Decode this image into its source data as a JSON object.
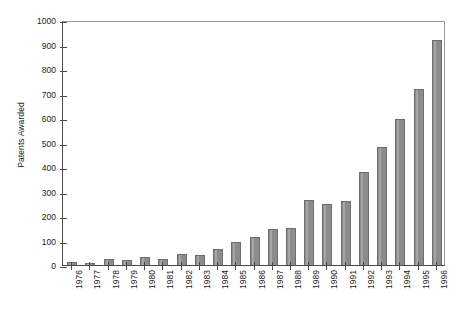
{
  "chart_data": {
    "type": "bar",
    "title": "",
    "xlabel": "",
    "ylabel": "Patents Awarded",
    "ylim": [
      0,
      1000
    ],
    "ytick_step": 100,
    "grid": false,
    "legend": "none",
    "bar_color": "#8c8c8c",
    "bar_edge_color": "#6e6e6e",
    "axis_color": "#4a4a4a",
    "categories": [
      "1976",
      "1977",
      "1978",
      "1979",
      "1980",
      "1981",
      "1982",
      "1983",
      "1984",
      "1985",
      "1986",
      "1987",
      "1988",
      "1989",
      "1990",
      "1991",
      "1992",
      "1993",
      "1994",
      "1995",
      "1996"
    ],
    "values": [
      12,
      8,
      25,
      22,
      32,
      25,
      45,
      42,
      65,
      92,
      113,
      148,
      152,
      265,
      248,
      263,
      378,
      480,
      598,
      718,
      918
    ],
    "ytick_labels": [
      "0",
      "100",
      "200",
      "300",
      "400",
      "500",
      "600",
      "700",
      "800",
      "900",
      "1000"
    ],
    "ytick_values": [
      0,
      100,
      200,
      300,
      400,
      500,
      600,
      700,
      800,
      900,
      1000
    ]
  }
}
